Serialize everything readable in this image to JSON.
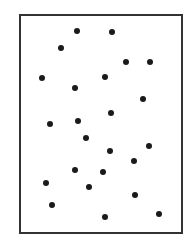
{
  "diagram": {
    "type": "dot-scatter-in-frame",
    "frame": {
      "x": 19,
      "y": 14,
      "width": 164,
      "height": 220,
      "stroke": "#333333",
      "fill": "#ffffff"
    },
    "dot_color": "#1a1a1a",
    "dot_size": 6,
    "dots": [
      {
        "x": 77,
        "y": 31
      },
      {
        "x": 112,
        "y": 32
      },
      {
        "x": 61,
        "y": 48
      },
      {
        "x": 126,
        "y": 62
      },
      {
        "x": 150,
        "y": 62
      },
      {
        "x": 42,
        "y": 78
      },
      {
        "x": 105,
        "y": 77
      },
      {
        "x": 75,
        "y": 88
      },
      {
        "x": 143,
        "y": 99
      },
      {
        "x": 111,
        "y": 113
      },
      {
        "x": 50,
        "y": 124
      },
      {
        "x": 78,
        "y": 121
      },
      {
        "x": 86,
        "y": 138
      },
      {
        "x": 110,
        "y": 151
      },
      {
        "x": 149,
        "y": 146
      },
      {
        "x": 134,
        "y": 161
      },
      {
        "x": 75,
        "y": 170
      },
      {
        "x": 103,
        "y": 172
      },
      {
        "x": 46,
        "y": 183
      },
      {
        "x": 89,
        "y": 187
      },
      {
        "x": 135,
        "y": 195
      },
      {
        "x": 52,
        "y": 205
      },
      {
        "x": 105,
        "y": 217
      },
      {
        "x": 159,
        "y": 214
      }
    ]
  }
}
